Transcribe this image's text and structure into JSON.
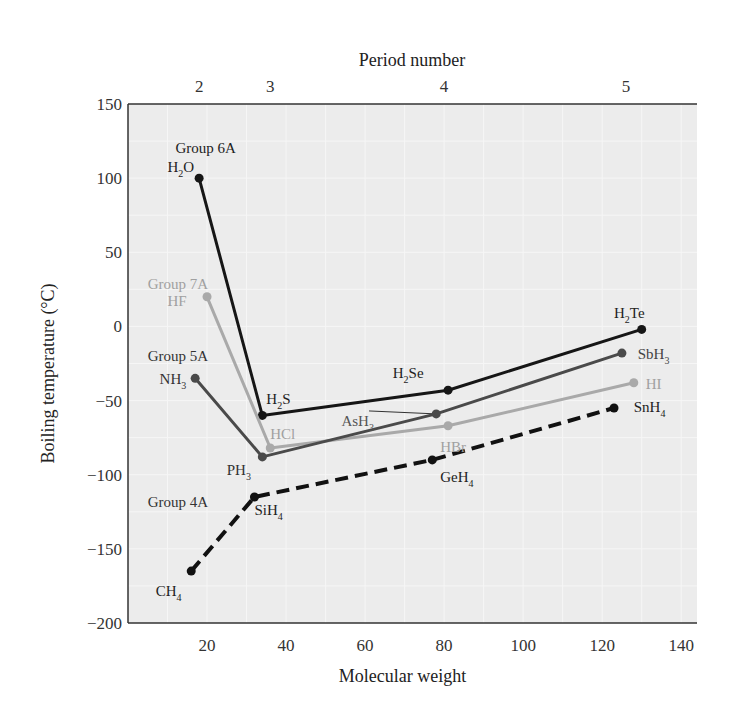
{
  "chart_data": {
    "type": "line",
    "title": "",
    "xlabel": "Molecular weight",
    "ylabel": "Boiling temperature (°C)",
    "top_xlabel": "Period number",
    "xlim": [
      0,
      144
    ],
    "ylim": [
      -200,
      150
    ],
    "x_ticks": [
      20,
      40,
      60,
      80,
      100,
      120,
      140
    ],
    "y_ticks": [
      150,
      100,
      50,
      0,
      -50,
      -100,
      -150,
      -200
    ],
    "y_tick_labels": [
      "150",
      "100",
      "50",
      "0",
      "−50",
      "−100",
      "−150",
      "−200"
    ],
    "period_ticks": [
      {
        "label": "2",
        "x": 18
      },
      {
        "label": "3",
        "x": 36
      },
      {
        "label": "4",
        "x": 80
      },
      {
        "label": "5",
        "x": 126
      }
    ],
    "grid": true,
    "series": [
      {
        "name": "Group 6A",
        "color": "#161616",
        "dashed": false,
        "group_label": {
          "text": "Group 6A",
          "x": 12,
          "y": 117,
          "color": "#222222"
        },
        "points": [
          {
            "label": "H2O",
            "base": "H",
            "sub": "2",
            "tail": "O",
            "x": 18,
            "y": 100,
            "lx": 10,
            "ly": 104,
            "lc": "#222222"
          },
          {
            "label": "H2S",
            "base": "H",
            "sub": "2",
            "tail": "S",
            "x": 34,
            "y": -60,
            "lx": 35,
            "ly": -52,
            "lc": "#222222"
          },
          {
            "label": "H2Se",
            "base": "H",
            "sub": "2",
            "tail": "Se",
            "x": 81,
            "y": -43,
            "lx": 67,
            "ly": -35,
            "lc": "#222222"
          },
          {
            "label": "H2Te",
            "base": "H",
            "sub": "2",
            "tail": "Te",
            "x": 130,
            "y": -2,
            "lx": 123,
            "ly": 6,
            "lc": "#222222"
          }
        ]
      },
      {
        "name": "Group 7A",
        "color": "#a9a9a9",
        "dashed": false,
        "group_label": {
          "text": "Group 7A",
          "x": 5,
          "y": 25,
          "color": "#a0a0a0"
        },
        "points": [
          {
            "label": "HF",
            "base": "HF",
            "sub": "",
            "tail": "",
            "x": 20,
            "y": 20,
            "lx": 10,
            "ly": 14,
            "lc": "#a0a0a0"
          },
          {
            "label": "HCl",
            "base": "HCl",
            "sub": "",
            "tail": "",
            "x": 36,
            "y": -82,
            "lx": 36,
            "ly": -76,
            "lc": "#a0a0a0"
          },
          {
            "label": "HBr",
            "base": "HBr",
            "sub": "",
            "tail": "",
            "x": 81,
            "y": -67,
            "lx": 79,
            "ly": -85,
            "lc": "#a0a0a0"
          },
          {
            "label": "HI",
            "base": "HI",
            "sub": "",
            "tail": "",
            "x": 128,
            "y": -38,
            "lx": 131,
            "ly": -42,
            "lc": "#a0a0a0"
          }
        ]
      },
      {
        "name": "Group 5A",
        "color": "#4a4a4a",
        "dashed": false,
        "group_label": {
          "text": "Group 5A",
          "x": 5,
          "y": -23,
          "color": "#333333"
        },
        "points": [
          {
            "label": "NH3",
            "base": "NH",
            "sub": "3",
            "tail": "",
            "x": 17,
            "y": -35,
            "lx": 8,
            "ly": -39,
            "lc": "#333333"
          },
          {
            "label": "PH3",
            "base": "PH",
            "sub": "3",
            "tail": "",
            "x": 34,
            "y": -88,
            "lx": 25,
            "ly": -100,
            "lc": "#333333"
          },
          {
            "label": "AsH3",
            "base": "AsH",
            "sub": "3",
            "tail": "",
            "x": 78,
            "y": -59,
            "lx": 54,
            "ly": -67,
            "lc": "#555555"
          },
          {
            "label": "SbH3",
            "base": "SbH",
            "sub": "3",
            "tail": "",
            "x": 125,
            "y": -18,
            "lx": 129,
            "ly": -22,
            "lc": "#444444"
          }
        ]
      },
      {
        "name": "Group 4A",
        "color": "#111111",
        "dashed": true,
        "group_label": {
          "text": "Group 4A",
          "x": 5,
          "y": -122,
          "color": "#333333"
        },
        "points": [
          {
            "label": "CH4",
            "base": "CH",
            "sub": "4",
            "tail": "",
            "x": 16,
            "y": -165,
            "lx": 7,
            "ly": -182,
            "lc": "#222222"
          },
          {
            "label": "SiH4",
            "base": "SiH",
            "sub": "4",
            "tail": "",
            "x": 32,
            "y": -115,
            "lx": 32,
            "ly": -127,
            "lc": "#222222"
          },
          {
            "label": "GeH4",
            "base": "GeH",
            "sub": "4",
            "tail": "",
            "x": 77,
            "y": -90,
            "lx": 79,
            "ly": -105,
            "lc": "#222222"
          },
          {
            "label": "SnH4",
            "base": "SnH",
            "sub": "4",
            "tail": "",
            "x": 123,
            "y": -55,
            "lx": 128,
            "ly": -58,
            "lc": "#222222"
          }
        ]
      }
    ],
    "annotations": [
      {
        "text": "AsH3 leader line",
        "from": [
          61,
          -57
        ],
        "to": [
          78,
          -59
        ]
      }
    ]
  }
}
